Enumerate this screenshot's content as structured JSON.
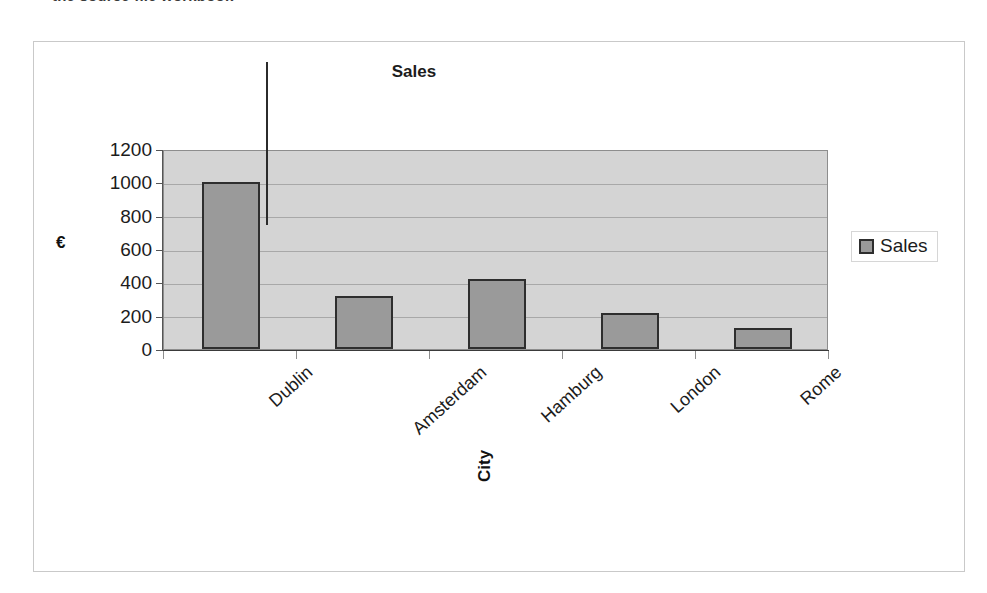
{
  "top_caption": "the source file     workbook",
  "chart": {
    "title": "Sales",
    "y_axis_title": "€",
    "x_axis_title": "City",
    "legend_label": "Sales",
    "swatch_icon": "legend-square-icon",
    "plot_background_color": "#d4d4d4",
    "bar_fill_color": "#9a9a9a",
    "bar_border_color": "#2e2e2e"
  },
  "chart_data": {
    "type": "bar",
    "title": "Sales",
    "xlabel": "City",
    "ylabel": "€",
    "categories": [
      "Dublin",
      "Amsterdam",
      "Hamburg",
      "London",
      "Rome"
    ],
    "values": [
      1000,
      320,
      420,
      215,
      125
    ],
    "series": [
      {
        "name": "Sales",
        "values": [
          1000,
          320,
          420,
          215,
          125
        ]
      }
    ],
    "ylim": [
      0,
      1200
    ],
    "yticks": [
      0,
      200,
      400,
      600,
      800,
      1000,
      1200
    ],
    "ytick_labels": [
      "0",
      "200",
      "400",
      "600",
      "800",
      "1000",
      "1200"
    ],
    "grid": true,
    "legend_position": "right",
    "annotations": [
      {
        "name": "callout-leader-line",
        "target_category": "Dublin",
        "target_value": 1000
      }
    ]
  }
}
